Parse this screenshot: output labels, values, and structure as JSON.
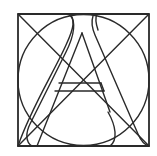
{
  "figure": {
    "letter": "A",
    "stroke_color": "#2a2a2a",
    "background_color": "#ffffff",
    "square": {
      "x": 18,
      "y": 14,
      "width": 131,
      "height": 132
    },
    "circle": {
      "cx": 83.5,
      "cy": 80,
      "r": 65.5
    },
    "diagonals": [
      {
        "x1": 18,
        "y1": 14,
        "x2": 149,
        "y2": 146
      },
      {
        "x1": 149,
        "y1": 14,
        "x2": 18,
        "y2": 146
      }
    ],
    "crossbar": {
      "y_top": 83,
      "y_bottom": 91,
      "x_left": 56,
      "x_right": 103
    },
    "inner_apex": {
      "x": 82,
      "y": 33
    }
  }
}
